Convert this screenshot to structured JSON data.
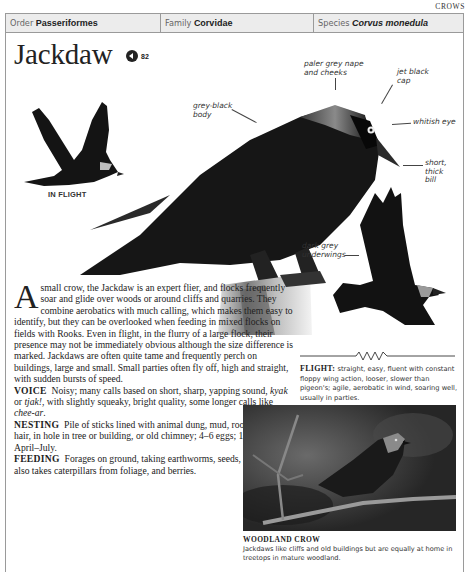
{
  "section": "CROWS",
  "taxonomy": {
    "order": {
      "key": "Order",
      "value": "Passeriformes"
    },
    "family": {
      "key": "Family",
      "value": "Corvidae"
    },
    "species": {
      "key": "Species",
      "value": "Corvus monedula"
    }
  },
  "title": "Jackdaw",
  "audio": {
    "icon": "speaker-icon",
    "track": "82"
  },
  "in_flight_label": "IN FLIGHT",
  "annotations": {
    "nape": [
      "paler grey nape",
      "and cheeks"
    ],
    "cap": [
      "jet black",
      "cap"
    ],
    "body": [
      "grey-black",
      "body"
    ],
    "eye": "whitish eye",
    "bill": [
      "short,",
      "thick",
      "bill"
    ],
    "underwings": [
      "dark grey",
      "underwings"
    ]
  },
  "intro": {
    "dropcap": "A",
    "text": "small crow, the Jackdaw is an expert flier, and flocks frequently soar and glide over woods or around cliffs and quarries. They combine aerobatics with much calling, which makes them easy to identify, but they can be overlooked when feeding in mixed flocks on fields with Rooks. Even in flight, in the flurry of a large flock, their presence may not be immediately obvious although the size difference is marked. Jackdaws are often quite tame and frequently perch on buildings, large and small. Small parties often fly off, high and straight, with sudden bursts of speed."
  },
  "sections": {
    "voice": {
      "label": "VOICE",
      "text_a": "Noisy; many calls based on short, sharp, yapping sound, ",
      "call1": "kyak",
      "or": " or ",
      "call2": "tjak!",
      "text_b": ", with slightly squeaky, bright quality, some longer calls like ",
      "call3": "chee-ar",
      "end": "."
    },
    "nesting": {
      "label": "NESTING",
      "text": "Pile of sticks lined with animal dung, mud, roots, moss, and hair, in hole in tree or building, or old chimney; 4–6 eggs; 1 brood; April–July."
    },
    "feeding": {
      "label": "FEEDING",
      "text": "Forages on ground, taking earthworms, seeds, and scraps; also takes caterpillars from foliage, and berries."
    }
  },
  "flight": {
    "label": "FLIGHT:",
    "text": "straight, easy, fluent with constant floppy wing action, looser, slower than pigeon's; agile, aerobatic in wind, soaring well, usually in parties."
  },
  "photo_caption": {
    "title": "WOODLAND CROW",
    "text": "Jackdaws like cliffs and old buildings but are equally at home in treetops in mature woodland."
  }
}
